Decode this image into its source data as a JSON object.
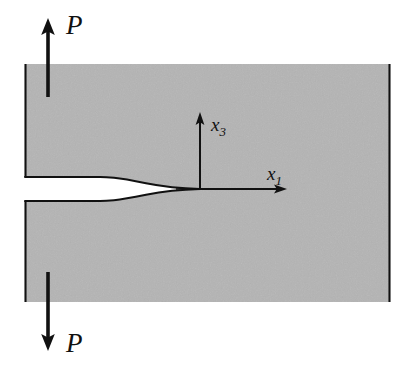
{
  "figure": {
    "background_color": "#ffffff",
    "body_fill_color": "#b4b4b4",
    "line_color": "#111111"
  },
  "labels": {
    "load_top": "P",
    "load_bottom": "P",
    "axis_vertical": "x",
    "axis_vertical_sub": "3",
    "axis_horizontal": "x",
    "axis_horizontal_sub": "1"
  },
  "icons": {
    "arrow_up": "arrow-up-icon",
    "arrow_down": "arrow-down-icon",
    "axis_arrow_up": "axis-arrow-up-icon",
    "axis_arrow_right": "axis-arrow-right-icon"
  },
  "geometry": {
    "body_left": 25,
    "body_right": 390,
    "body_top": 64,
    "body_bottom": 302,
    "crack_mouth_upper_y": 177,
    "crack_mouth_lower_y": 203,
    "crack_flat_end_x": 100,
    "crack_tip_x": 200,
    "crack_tip_y": 189,
    "origin_x": 200,
    "origin_y": 189,
    "axis_vertical_tip_y": 113,
    "axis_horizontal_tip_x": 286,
    "load_arrow_x": 48,
    "load_top_arrow_tip_y": 20,
    "load_top_arrow_tail_y": 97,
    "load_bottom_arrow_tip_y": 349,
    "load_bottom_arrow_tail_y": 272
  },
  "label_positions": {
    "load_top": {
      "x": 66,
      "y": 34
    },
    "load_bottom": {
      "x": 66,
      "y": 352
    },
    "axis_vertical": {
      "x": 211,
      "y": 131
    },
    "axis_horizontal": {
      "x": 267,
      "y": 183
    }
  }
}
